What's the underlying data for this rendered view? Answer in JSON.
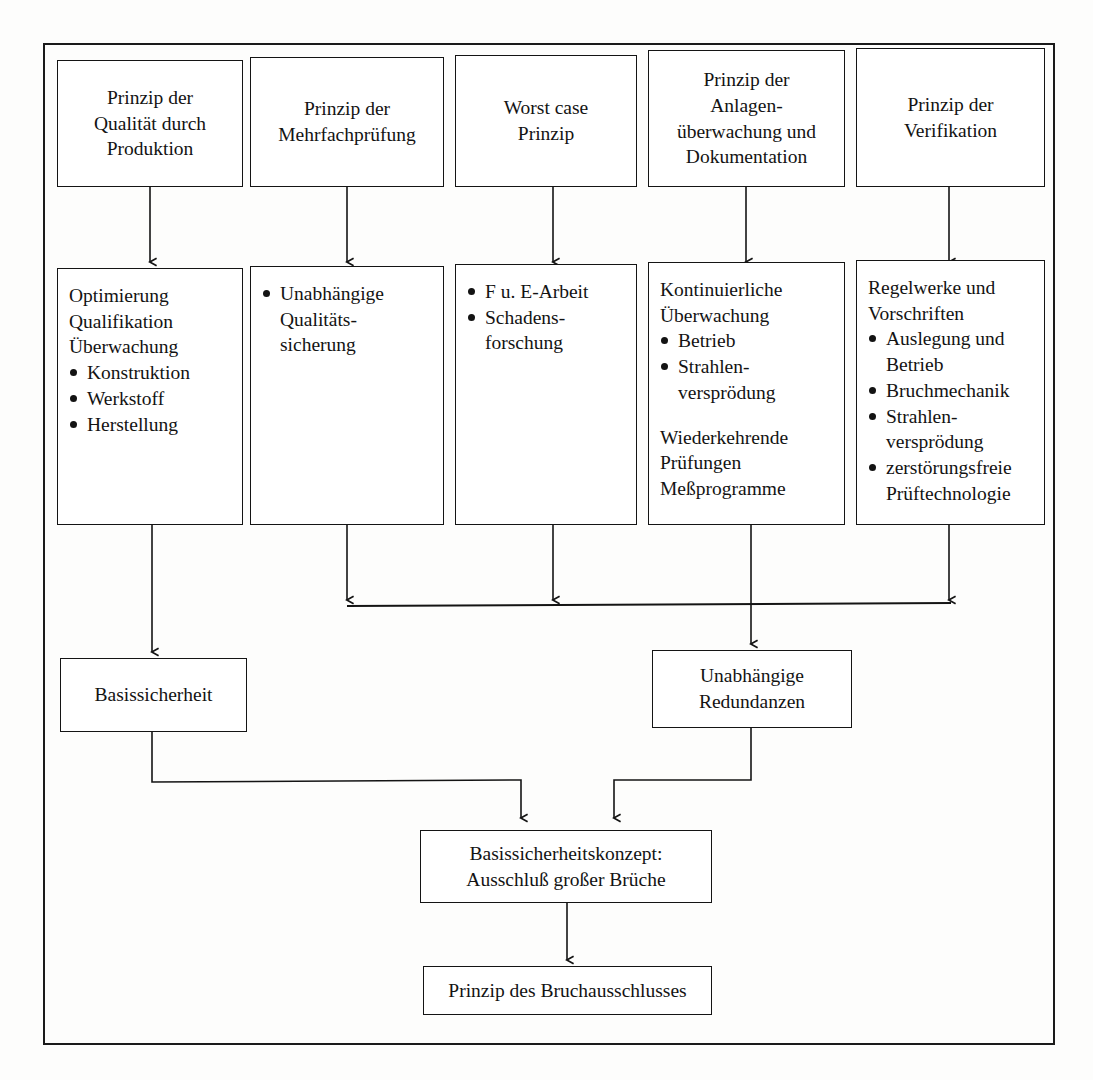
{
  "diagram": {
    "row1": [
      {
        "id": "qualitaet-durch-produktion",
        "lines": [
          "Prinzip der",
          "Qualität durch",
          "Produktion"
        ]
      },
      {
        "id": "mehrfachpruefung",
        "lines": [
          "Prinzip der",
          "Mehrfachprüfung"
        ]
      },
      {
        "id": "worst-case",
        "lines": [
          "Worst case",
          "Prinzip"
        ]
      },
      {
        "id": "anlagenueberwachung",
        "lines": [
          "Prinzip der",
          "Anlagen-",
          "überwachung und",
          "Dokumentation"
        ]
      },
      {
        "id": "verifikation",
        "lines": [
          "Prinzip der",
          "Verifikation"
        ]
      }
    ],
    "row2": [
      {
        "id": "optimierung",
        "plain": [
          "Optimierung",
          "Qualifikation",
          "Überwachung"
        ],
        "bullets": [
          "Konstruktion",
          "Werkstoff",
          "Herstellung"
        ],
        "plain_after": []
      },
      {
        "id": "unabhaengige-qualitaetssicherung",
        "plain": [],
        "bullets": [
          "Unabhängige\nQualitäts-\nsicherung"
        ],
        "plain_after": []
      },
      {
        "id": "fue-arbeit",
        "plain": [],
        "bullets": [
          "F u. E-Arbeit",
          "Schadens-\nforschung"
        ],
        "plain_after": []
      },
      {
        "id": "kontinuierliche-ueberwachung",
        "plain": [
          "Kontinuierliche",
          "Überwachung"
        ],
        "bullets": [
          "Betrieb",
          "Strahlen-\nversprödung"
        ],
        "plain_after": [
          "Wiederkehrende",
          "Prüfungen",
          "Meßprogramme"
        ]
      },
      {
        "id": "regelwerke-vorschriften",
        "plain": [
          "Regelwerke und",
          "Vorschriften"
        ],
        "bullets": [
          "Auslegung und\nBetrieb",
          "Bruchmechanik",
          "Strahlen-\nversprödung",
          "zerstörungsfreie\nPrüftechnologie"
        ],
        "plain_after": []
      }
    ],
    "row3": [
      {
        "id": "basissicherheit",
        "lines": [
          "Basissicherheit"
        ]
      },
      {
        "id": "unabhaengige-redundanzen",
        "lines": [
          "Unabhängige",
          "Redundanzen"
        ]
      }
    ],
    "row4": {
      "id": "basissicherheitskonzept",
      "lines": [
        "Basissicherheitskonzept:",
        "Ausschluß großer Brüche"
      ]
    },
    "row5": {
      "id": "prinzip-bruchausschluss",
      "lines": [
        "Prinzip des Bruchausschlusses"
      ]
    },
    "colors": {
      "line": "#141414",
      "box_border": "#141414",
      "background": "#ffffff",
      "text": "#131313"
    }
  }
}
